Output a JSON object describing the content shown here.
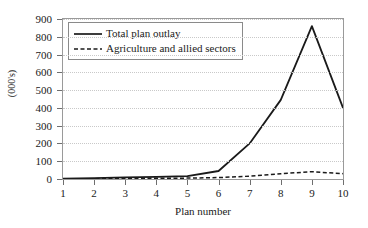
{
  "chart_data": {
    "type": "line",
    "title": "",
    "xlabel": "Plan number",
    "ylabel": "(000's)",
    "x": [
      1,
      2,
      3,
      4,
      5,
      6,
      7,
      8,
      9,
      10
    ],
    "xticklabels": [
      "1",
      "2",
      "3",
      "4",
      "5",
      "6",
      "7",
      "8",
      "9",
      "10"
    ],
    "yticklabels": [
      "0",
      "100",
      "200",
      "300",
      "400",
      "500",
      "600",
      "700",
      "800",
      "900"
    ],
    "yticks": [
      0,
      100,
      200,
      300,
      400,
      500,
      600,
      700,
      800,
      900
    ],
    "ylim": [
      0,
      900
    ],
    "xlim": [
      1,
      10
    ],
    "grid": "horizontal-dotted",
    "legend_position": "upper-left-inside",
    "series": [
      {
        "name": "Total plan outlay",
        "style": "solid",
        "color": "#1a1a1a",
        "values": [
          2,
          5,
          9,
          12,
          16,
          45,
          200,
          445,
          860,
          400
        ]
      },
      {
        "name": "Agriculture and allied sectors",
        "style": "dashed",
        "color": "#1a1a1a",
        "values": [
          1,
          2,
          3,
          4,
          5,
          8,
          16,
          30,
          41,
          30
        ]
      }
    ]
  },
  "legend": {
    "items": [
      {
        "label": "Total plan outlay",
        "style": "solid"
      },
      {
        "label": "Agriculture and allied sectors",
        "style": "dashed"
      }
    ]
  }
}
